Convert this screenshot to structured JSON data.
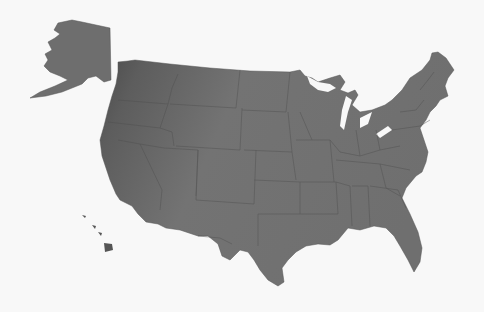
{
  "map": {
    "type": "us-states-silhouette",
    "regions": [
      "contiguous-us",
      "alaska",
      "hawaii"
    ],
    "colors": {
      "background": "#f8f8f8",
      "land_dark": "#4a4a4a",
      "land_light": "#7a7a7a",
      "border": "#4d4d4d"
    }
  }
}
